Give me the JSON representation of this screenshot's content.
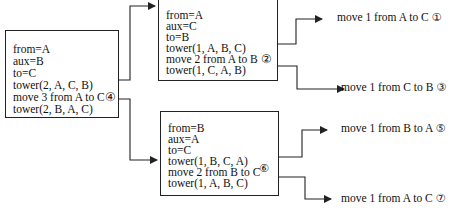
{
  "diagram": {
    "boxes": [
      {
        "id": "root",
        "lines": [
          "from=A",
          "aux=B",
          "to=C",
          "tower(2, A, C, B)",
          "move 3 from A to C④",
          "tower(2, B, A, C)"
        ]
      },
      {
        "id": "call-upper",
        "lines": [
          "from=A",
          "aux=C",
          "to=B",
          "tower(1, A, B, C)",
          "move 2 from A to B ②",
          "tower(1, C, A, B)"
        ]
      },
      {
        "id": "call-lower",
        "lines": [
          "from=B",
          "aux=A",
          "to=C",
          "tower(1, B, C, A)",
          "move 2 from B to C",
          "tower(1, A, B, C)"
        ],
        "step_marker": "⑥"
      }
    ],
    "moves": [
      {
        "text": "move 1 from A to C",
        "step": "①"
      },
      {
        "text": "move 1 from C to B",
        "step": "③"
      },
      {
        "text": "move 1 from B to A",
        "step": "⑤"
      },
      {
        "text": "move 1 from A to C",
        "step": "⑦"
      }
    ],
    "colors": {
      "stroke": "#222222",
      "text": "#111111",
      "background": "#ffffff"
    }
  }
}
